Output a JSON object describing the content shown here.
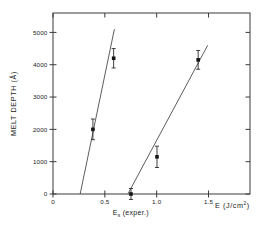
{
  "chart_data": {
    "type": "scatter",
    "title": "",
    "xlabel": "E (J/cm2)",
    "xlabel_main": "E (J/cm",
    "xlabel_exp": "2",
    "xlabel_close": ")",
    "ylabel": "MELT DEPTH (Å)",
    "xlim": [
      0,
      1.9
    ],
    "ylim": [
      0,
      5600
    ],
    "grid": false,
    "legend": "none",
    "xticks": [
      0,
      0.5,
      1.0,
      1.5
    ],
    "xticklabels": [
      "0",
      "0.5",
      "1.0",
      "1.5"
    ],
    "yticks": [
      0,
      1000,
      2000,
      3000,
      4000,
      5000
    ],
    "yticklabels": [
      "0",
      "1000",
      "2000",
      "3000",
      "4000",
      "5000"
    ],
    "annotations": [
      {
        "text_main": "E",
        "text_sub": "s",
        "text_rest": "(exper.)",
        "x": 0.75,
        "y": -900,
        "name": "threshold-energy-annotation"
      }
    ],
    "series": [
      {
        "name": "fit-line-left",
        "type": "line",
        "points": [
          [
            0.262,
            0
          ],
          [
            0.592,
            5100
          ]
        ]
      },
      {
        "name": "fit-line-right",
        "type": "line",
        "points": [
          [
            0.722,
            0
          ],
          [
            1.492,
            4600
          ]
        ]
      },
      {
        "name": "melt-depth-points-left",
        "type": "scatter",
        "points": [
          {
            "x": 0.385,
            "y": 2000,
            "yerr": 320
          },
          {
            "x": 0.585,
            "y": 4200,
            "yerr": 300
          }
        ]
      },
      {
        "name": "melt-depth-points-right",
        "type": "scatter",
        "points": [
          {
            "x": 0.752,
            "y": 0,
            "yerr": 170
          },
          {
            "x": 1.003,
            "y": 1150,
            "yerr": 330
          },
          {
            "x": 1.4,
            "y": 4150,
            "yerr": 290
          }
        ]
      }
    ],
    "colors": {
      "axis": "#3a3a3a",
      "line": "#4a4a4a",
      "marker": "#141414",
      "background": "#ffffff"
    }
  }
}
